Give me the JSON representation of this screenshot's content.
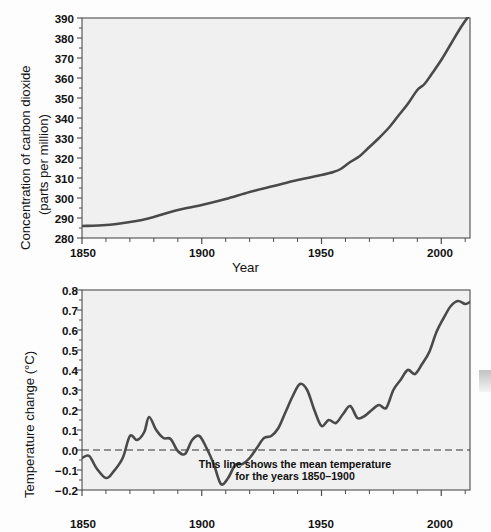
{
  "page": {
    "background_color": "#fdfdfd",
    "plot_background_color": "#f0f0f0",
    "line_color": "#4a4a4a",
    "axis_color": "#4d4d4d"
  },
  "chart_data": [
    {
      "id": "co2",
      "type": "line",
      "title": "",
      "xlabel": "Year",
      "ylabel": "Concentration of carbon dioxide (parts per million)",
      "ylabel_line1": "Concentration of carbon dioxide",
      "ylabel_line2": "(parts per million)",
      "xlim": [
        1850,
        2012
      ],
      "ylim": [
        280,
        390
      ],
      "ytick_labels": [
        "390",
        "380",
        "370",
        "360",
        "350",
        "340",
        "330",
        "320",
        "310",
        "300",
        "290",
        "280"
      ],
      "yticks": [
        390,
        380,
        370,
        360,
        350,
        340,
        330,
        320,
        310,
        300,
        290,
        280
      ],
      "xtick_labels": [
        "1850",
        "1900",
        "1950",
        "2000"
      ],
      "xticks": [
        1850,
        1900,
        1950,
        2000
      ],
      "x_minor_step": 10,
      "grid": false,
      "legend": "none",
      "series": [
        {
          "name": "CO2 concentration",
          "x": [
            1850,
            1860,
            1870,
            1875,
            1880,
            1890,
            1900,
            1910,
            1920,
            1930,
            1940,
            1950,
            1955,
            1958,
            1962,
            1966,
            1970,
            1974,
            1978,
            1982,
            1986,
            1990,
            1993,
            1996,
            2000,
            2004,
            2008,
            2012
          ],
          "values": [
            286,
            286.5,
            288,
            289,
            290.5,
            294,
            296.5,
            299.5,
            303,
            306,
            309,
            311.5,
            313,
            314.5,
            318,
            321,
            325.5,
            330,
            335,
            341,
            347,
            354,
            357,
            362,
            369,
            377,
            385,
            392
          ]
        }
      ]
    },
    {
      "id": "temperature",
      "type": "line",
      "title": "",
      "xlabel": "",
      "ylabel": "Temperature change (°C)",
      "xlim": [
        1850,
        2012
      ],
      "ylim": [
        -0.2,
        0.8
      ],
      "ytick_labels": [
        "0.8",
        "0.7",
        "0.6",
        "0.5",
        "0.4",
        "0.3",
        "0.2",
        "0.1",
        "0.0",
        "−0.1",
        "−0.2"
      ],
      "yticks": [
        0.8,
        0.7,
        0.6,
        0.5,
        0.4,
        0.3,
        0.2,
        0.1,
        0.0,
        -0.1,
        -0.2
      ],
      "xtick_labels": [
        "1850",
        "1900",
        "1950",
        "2000"
      ],
      "xticks": [
        1850,
        1900,
        1950,
        2000
      ],
      "x_minor_step": 10,
      "grid": false,
      "legend": "none",
      "reference_line": {
        "value": 0.0,
        "style": "dashed",
        "label_line1": "This line shows the mean temperature",
        "label_line2": "for the years 1850–1900"
      },
      "series": [
        {
          "name": "Temperature anomaly",
          "x": [
            1850,
            1853,
            1856,
            1860,
            1863,
            1867,
            1870,
            1873,
            1876,
            1878,
            1881,
            1884,
            1887,
            1890,
            1893,
            1896,
            1899,
            1902,
            1905,
            1908,
            1911,
            1914,
            1917,
            1920,
            1923,
            1926,
            1929,
            1932,
            1935,
            1938,
            1941,
            1944,
            1947,
            1950,
            1953,
            1956,
            1959,
            1962,
            1965,
            1968,
            1971,
            1974,
            1977,
            1980,
            1983,
            1986,
            1989,
            1992,
            1995,
            1998,
            2001,
            2004,
            2007,
            2010,
            2012
          ],
          "values": [
            -0.04,
            -0.03,
            -0.09,
            -0.14,
            -0.11,
            -0.04,
            0.07,
            0.05,
            0.09,
            0.165,
            0.1,
            0.06,
            0.055,
            -0.005,
            -0.02,
            0.05,
            0.07,
            0.01,
            -0.07,
            -0.17,
            -0.14,
            -0.075,
            -0.07,
            -0.04,
            0.01,
            0.06,
            0.07,
            0.11,
            0.19,
            0.27,
            0.33,
            0.3,
            0.2,
            0.12,
            0.15,
            0.135,
            0.18,
            0.22,
            0.16,
            0.17,
            0.2,
            0.225,
            0.21,
            0.3,
            0.35,
            0.4,
            0.38,
            0.43,
            0.49,
            0.59,
            0.66,
            0.72,
            0.745,
            0.73,
            0.74
          ]
        }
      ]
    }
  ]
}
